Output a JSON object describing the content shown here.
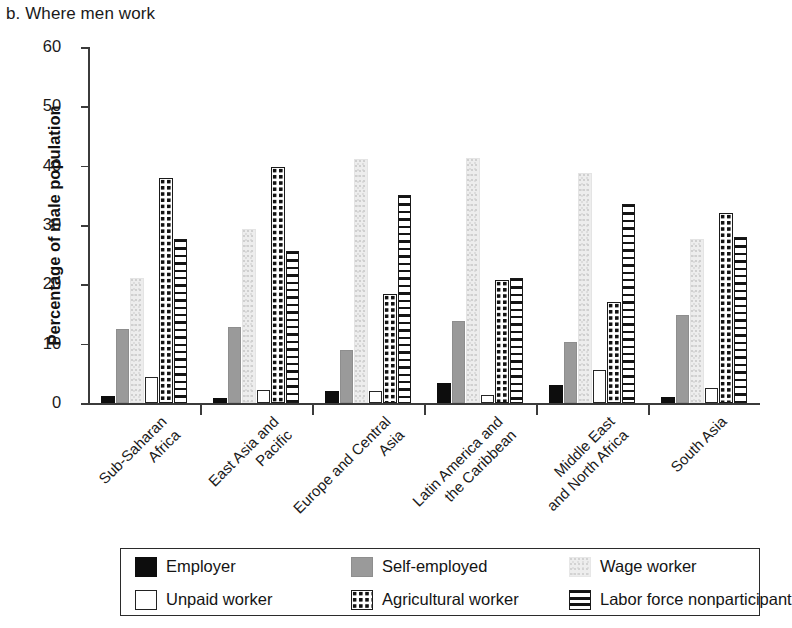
{
  "panel": {
    "title": "b. Where men work"
  },
  "axes": {
    "y_label": "Percentage of male population",
    "y_ticks": [
      "0",
      "10",
      "20",
      "30",
      "40",
      "50",
      "60"
    ]
  },
  "legend": {
    "items": [
      {
        "key": "employer",
        "label": "Employer",
        "swatch": "solid-black-swatch"
      },
      {
        "key": "selfemployed",
        "label": "Self-employed",
        "swatch": "solid-gray-swatch"
      },
      {
        "key": "wage",
        "label": "Wage worker",
        "swatch": "light-stipple-swatch"
      },
      {
        "key": "unpaid",
        "label": "Unpaid worker",
        "swatch": "white-outline-swatch"
      },
      {
        "key": "agricultural",
        "label": "Agricultural worker",
        "swatch": "polka-dot-swatch"
      },
      {
        "key": "labor",
        "label": "Labor force nonparticipant",
        "swatch": "horizontal-stripe-swatch"
      }
    ]
  },
  "chart_data": {
    "type": "bar",
    "title": "b. Where men work",
    "xlabel": "",
    "ylabel": "Percentage of male population",
    "ylim": [
      0,
      60
    ],
    "yticks": [
      0,
      10,
      20,
      30,
      40,
      50,
      60
    ],
    "grid": false,
    "legend_position": "bottom",
    "categories": [
      "Sub-Saharan Africa",
      "East Asia and Pacific",
      "Europe and Central Asia",
      "Latin America and the Caribbean",
      "Middle East and North Africa",
      "South Asia"
    ],
    "category_lines": [
      [
        "Sub-Saharan",
        "Africa"
      ],
      [
        "East Asia and",
        "Pacific"
      ],
      [
        "Europe and Central",
        "Asia"
      ],
      [
        "Latin America and",
        "the Caribbean"
      ],
      [
        "Middle East",
        "and North Africa"
      ],
      [
        "South Asia"
      ]
    ],
    "series": [
      {
        "name": "Employer",
        "key": "employer",
        "values": [
          1.2,
          0.8,
          2.0,
          3.4,
          3.1,
          1.0
        ]
      },
      {
        "name": "Self-employed",
        "key": "selfemployed",
        "values": [
          12.4,
          12.8,
          9.0,
          13.9,
          10.3,
          14.9
        ]
      },
      {
        "name": "Wage worker",
        "key": "wage",
        "values": [
          21.0,
          29.4,
          41.1,
          41.3,
          38.8,
          27.7
        ]
      },
      {
        "name": "Unpaid worker",
        "key": "unpaid",
        "values": [
          4.4,
          2.2,
          2.0,
          1.4,
          5.5,
          2.5
        ]
      },
      {
        "name": "Agricultural worker",
        "key": "agricultural",
        "values": [
          38.0,
          39.8,
          18.3,
          20.8,
          17.0,
          32.0
        ]
      },
      {
        "name": "Labor force nonparticipant",
        "key": "labor",
        "values": [
          27.7,
          25.7,
          35.0,
          21.1,
          33.6,
          28.0
        ]
      }
    ]
  }
}
